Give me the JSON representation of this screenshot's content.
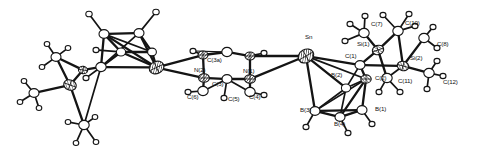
{
  "figure": {
    "kind": "ortep-crystal-structure-diagram",
    "caption": "",
    "background_color": "#ffffff",
    "line_color": "#141414",
    "width": 483,
    "height": 159
  },
  "labels": [
    {
      "id": "Sn",
      "text": "Sn",
      "x": 305,
      "y": 39
    },
    {
      "id": "N1",
      "text": "N(1)",
      "x": 243,
      "y": 73
    },
    {
      "id": "N2",
      "text": "N(2)",
      "x": 194,
      "y": 72
    },
    {
      "id": "C3a",
      "text": "C(3a)",
      "x": 207,
      "y": 62
    },
    {
      "id": "C3",
      "text": "C(3)",
      "x": 212,
      "y": 86
    },
    {
      "id": "C4",
      "text": "C(4)",
      "x": 249,
      "y": 99
    },
    {
      "id": "C5",
      "text": "C(5)",
      "x": 228,
      "y": 101
    },
    {
      "id": "C6",
      "text": "C(6)",
      "x": 187,
      "y": 99
    },
    {
      "id": "C1",
      "text": "C(1)",
      "x": 345,
      "y": 58
    },
    {
      "id": "C2",
      "text": "C(2)",
      "x": 375,
      "y": 80
    },
    {
      "id": "B1",
      "text": "B(1)",
      "x": 375,
      "y": 111
    },
    {
      "id": "B2",
      "text": "B(2)",
      "x": 331,
      "y": 77
    },
    {
      "id": "B3",
      "text": "B(3)",
      "x": 300,
      "y": 112
    },
    {
      "id": "B4",
      "text": "B(4)",
      "x": 334,
      "y": 126
    },
    {
      "id": "Si1",
      "text": "Si(1)",
      "x": 357,
      "y": 46
    },
    {
      "id": "Si2",
      "text": "Si(2)",
      "x": 410,
      "y": 60
    },
    {
      "id": "C7",
      "text": "C(7)",
      "x": 371,
      "y": 26
    },
    {
      "id": "C8",
      "text": "C(8)",
      "x": 437,
      "y": 46
    },
    {
      "id": "C10",
      "text": "C(10)",
      "x": 405,
      "y": 25
    },
    {
      "id": "C11",
      "text": "C(11)",
      "x": 398,
      "y": 83
    },
    {
      "id": "C12",
      "text": "C(12)",
      "x": 443,
      "y": 84
    }
  ],
  "atoms": [
    {
      "id": "Sn",
      "element": "Sn",
      "x": 306.0,
      "y": 56.0,
      "r": 8.2,
      "style": "hatch",
      "rot": -30
    },
    {
      "id": "Fe1",
      "element": "Fe",
      "x": 156.5,
      "y": 67.5,
      "r": 7.6,
      "style": "hatch",
      "rot": -25
    },
    {
      "id": "Si0",
      "element": "Si",
      "x": 70.0,
      "y": 85.0,
      "r": 6.4,
      "style": "hatch2",
      "rot": 20
    },
    {
      "id": "Si0b",
      "element": "Si",
      "x": 83.0,
      "y": 70.0,
      "r": 4.6,
      "style": "hatch2",
      "rot": 10
    },
    {
      "id": "Cp1",
      "element": "C",
      "x": 104.0,
      "y": 34.0,
      "r": 5.0,
      "style": "open"
    },
    {
      "id": "Cp2",
      "element": "C",
      "x": 139.0,
      "y": 33.0,
      "r": 5.0,
      "style": "open"
    },
    {
      "id": "Cp3",
      "element": "C",
      "x": 152.0,
      "y": 52.0,
      "r": 4.4,
      "style": "open"
    },
    {
      "id": "Cp4",
      "element": "C",
      "x": 121.0,
      "y": 52.0,
      "r": 4.6,
      "style": "open"
    },
    {
      "id": "Cp5",
      "element": "C",
      "x": 101.0,
      "y": 67.0,
      "r": 5.2,
      "style": "open"
    },
    {
      "id": "H1",
      "element": "H",
      "x": 89.0,
      "y": 14.0,
      "r": 3.2,
      "style": "open"
    },
    {
      "id": "H2",
      "element": "H",
      "x": 156.0,
      "y": 12.0,
      "r": 3.2,
      "style": "open"
    },
    {
      "id": "H3",
      "element": "H",
      "x": 96.0,
      "y": 50.0,
      "r": 3.0,
      "style": "open"
    },
    {
      "id": "H4",
      "element": "H",
      "x": 86.0,
      "y": 78.0,
      "r": 3.0,
      "style": "open"
    },
    {
      "id": "Ca",
      "element": "C",
      "x": 56.0,
      "y": 57.0,
      "r": 5.0,
      "style": "open"
    },
    {
      "id": "Cb",
      "element": "C",
      "x": 34.0,
      "y": 93.0,
      "r": 5.0,
      "style": "open"
    },
    {
      "id": "Cc",
      "element": "C",
      "x": 84.0,
      "y": 125.0,
      "r": 5.2,
      "style": "open"
    },
    {
      "id": "Ha1",
      "element": "H",
      "x": 47.0,
      "y": 44.0,
      "r": 2.8,
      "style": "open"
    },
    {
      "id": "Ha2",
      "element": "H",
      "x": 68.0,
      "y": 48.0,
      "r": 2.8,
      "style": "open"
    },
    {
      "id": "Ha3",
      "element": "H",
      "x": 42.0,
      "y": 67.0,
      "r": 2.8,
      "style": "open"
    },
    {
      "id": "Hb1",
      "element": "H",
      "x": 24.0,
      "y": 81.0,
      "r": 2.8,
      "style": "open"
    },
    {
      "id": "Hb2",
      "element": "H",
      "x": 20.0,
      "y": 102.0,
      "r": 2.8,
      "style": "open"
    },
    {
      "id": "Hb3",
      "element": "H",
      "x": 39.0,
      "y": 108.0,
      "r": 2.8,
      "style": "open"
    },
    {
      "id": "Hc1",
      "element": "H",
      "x": 68.0,
      "y": 122.0,
      "r": 2.8,
      "style": "open"
    },
    {
      "id": "Hc2",
      "element": "H",
      "x": 95.0,
      "y": 117.0,
      "r": 2.8,
      "style": "open"
    },
    {
      "id": "Hc3",
      "element": "H",
      "x": 76.0,
      "y": 143.0,
      "r": 2.8,
      "style": "open"
    },
    {
      "id": "Hc4",
      "element": "H",
      "x": 96.0,
      "y": 142.0,
      "r": 2.8,
      "style": "open"
    },
    {
      "id": "N2",
      "element": "N",
      "x": 204.0,
      "y": 78.0,
      "r": 5.4,
      "style": "hatch"
    },
    {
      "id": "N1",
      "element": "N",
      "x": 250.0,
      "y": 79.0,
      "r": 5.4,
      "style": "hatch"
    },
    {
      "id": "C3a",
      "element": "C",
      "x": 203.0,
      "y": 55.0,
      "r": 5.0,
      "style": "hatch"
    },
    {
      "id": "Ct2",
      "element": "C",
      "x": 250.0,
      "y": 56.0,
      "r": 5.0,
      "style": "hatch"
    },
    {
      "id": "C3",
      "element": "C",
      "x": 227.0,
      "y": 79.0,
      "r": 5.0,
      "style": "open"
    },
    {
      "id": "Ct1",
      "element": "C",
      "x": 227.0,
      "y": 52.0,
      "r": 5.2,
      "style": "open"
    },
    {
      "id": "C6",
      "element": "C",
      "x": 203.0,
      "y": 91.0,
      "r": 5.2,
      "style": "open"
    },
    {
      "id": "C4",
      "element": "C",
      "x": 250.0,
      "y": 92.0,
      "r": 5.2,
      "style": "open"
    },
    {
      "id": "Hr1",
      "element": "H",
      "x": 193.0,
      "y": 51.0,
      "r": 3.0,
      "style": "open"
    },
    {
      "id": "Hr2",
      "element": "H",
      "x": 264.0,
      "y": 53.0,
      "r": 3.0,
      "style": "open"
    },
    {
      "id": "Hr3",
      "element": "H",
      "x": 188.0,
      "y": 92.0,
      "r": 3.0,
      "style": "open"
    },
    {
      "id": "Hr4",
      "element": "H",
      "x": 264.0,
      "y": 95.0,
      "r": 3.0,
      "style": "open"
    },
    {
      "id": "Hr5",
      "element": "H",
      "x": 224.0,
      "y": 98.0,
      "r": 3.0,
      "style": "open"
    },
    {
      "id": "C1",
      "element": "C",
      "x": 360.0,
      "y": 65.0,
      "r": 5.0,
      "style": "open"
    },
    {
      "id": "C2",
      "element": "C",
      "x": 366.0,
      "y": 79.0,
      "r": 5.2,
      "style": "hatch2"
    },
    {
      "id": "B2",
      "element": "B",
      "x": 346.0,
      "y": 88.0,
      "r": 4.6,
      "style": "open"
    },
    {
      "id": "B1",
      "element": "B",
      "x": 362.0,
      "y": 110.0,
      "r": 5.0,
      "style": "open"
    },
    {
      "id": "B3",
      "element": "B",
      "x": 315.0,
      "y": 111.0,
      "r": 5.0,
      "style": "open"
    },
    {
      "id": "B4",
      "element": "B",
      "x": 340.0,
      "y": 117.0,
      "r": 5.0,
      "style": "open"
    },
    {
      "id": "Hb4",
      "element": "H",
      "x": 306.0,
      "y": 127.0,
      "r": 3.0,
      "style": "open"
    },
    {
      "id": "Hb5",
      "element": "H",
      "x": 348.0,
      "y": 133.0,
      "r": 3.0,
      "style": "open"
    },
    {
      "id": "Hb6",
      "element": "H",
      "x": 372.0,
      "y": 124.0,
      "r": 3.0,
      "style": "open"
    },
    {
      "id": "Si1",
      "element": "Si",
      "x": 378.0,
      "y": 50.0,
      "r": 5.8,
      "style": "hatch2",
      "rot": -20
    },
    {
      "id": "Si2",
      "element": "Si",
      "x": 403.0,
      "y": 66.0,
      "r": 5.8,
      "style": "hatch2",
      "rot": 15
    },
    {
      "id": "C7",
      "element": "C",
      "x": 364.0,
      "y": 33.0,
      "r": 5.2,
      "style": "open"
    },
    {
      "id": "C10",
      "element": "C",
      "x": 398.0,
      "y": 31.0,
      "r": 5.2,
      "style": "open"
    },
    {
      "id": "C8",
      "element": "C",
      "x": 424.0,
      "y": 38.0,
      "r": 5.2,
      "style": "open"
    },
    {
      "id": "C11",
      "element": "C",
      "x": 387.0,
      "y": 78.0,
      "r": 5.2,
      "style": "open"
    },
    {
      "id": "C12",
      "element": "C",
      "x": 429.0,
      "y": 73.0,
      "r": 5.2,
      "style": "open"
    },
    {
      "id": "Hs1",
      "element": "H",
      "x": 350.0,
      "y": 24.0,
      "r": 3.0,
      "style": "open"
    },
    {
      "id": "Hs2",
      "element": "H",
      "x": 365.0,
      "y": 16.0,
      "r": 3.0,
      "style": "open"
    },
    {
      "id": "Hs3",
      "element": "H",
      "x": 345.0,
      "y": 41.0,
      "r": 3.0,
      "style": "open"
    },
    {
      "id": "Hs4",
      "element": "H",
      "x": 383.0,
      "y": 15.0,
      "r": 3.0,
      "style": "open"
    },
    {
      "id": "Hs5",
      "element": "H",
      "x": 409.0,
      "y": 14.0,
      "r": 3.0,
      "style": "open"
    },
    {
      "id": "Hs6",
      "element": "H",
      "x": 415.0,
      "y": 26.0,
      "r": 3.0,
      "style": "open"
    },
    {
      "id": "Hs7",
      "element": "H",
      "x": 433.0,
      "y": 27.0,
      "r": 3.0,
      "style": "open"
    },
    {
      "id": "Hs8",
      "element": "H",
      "x": 437.0,
      "y": 48.0,
      "r": 3.0,
      "style": "open"
    },
    {
      "id": "Hs9",
      "element": "H",
      "x": 379.0,
      "y": 92.0,
      "r": 3.0,
      "style": "open"
    },
    {
      "id": "Hs10",
      "element": "H",
      "x": 400.0,
      "y": 92.0,
      "r": 3.0,
      "style": "open"
    },
    {
      "id": "Hs11",
      "element": "H",
      "x": 437.0,
      "y": 61.0,
      "r": 3.0,
      "style": "open"
    },
    {
      "id": "Hs12",
      "element": "H",
      "x": 443.0,
      "y": 76.0,
      "r": 3.0,
      "style": "open"
    },
    {
      "id": "Hs13",
      "element": "H",
      "x": 427.0,
      "y": 89.0,
      "r": 3.0,
      "style": "open"
    }
  ],
  "bonds": [
    {
      "a": "Cp1",
      "b": "Cp2",
      "w": "thick"
    },
    {
      "a": "Cp2",
      "b": "Cp3",
      "w": "thick"
    },
    {
      "a": "Cp3",
      "b": "Cp4",
      "w": "thick"
    },
    {
      "a": "Cp4",
      "b": "Cp1",
      "w": "thick"
    },
    {
      "a": "Cp4",
      "b": "Cp5",
      "w": "thick"
    },
    {
      "a": "Cp5",
      "b": "Cp1",
      "w": "thick"
    },
    {
      "a": "Cp1",
      "b": "Fe1",
      "w": "thick"
    },
    {
      "a": "Cp2",
      "b": "Fe1",
      "w": "thick"
    },
    {
      "a": "Cp3",
      "b": "Fe1",
      "w": "thick"
    },
    {
      "a": "Cp4",
      "b": "Fe1",
      "w": "thick"
    },
    {
      "a": "Cp5",
      "b": "Fe1",
      "w": "thick"
    },
    {
      "a": "Cp2",
      "b": "Cp5",
      "w": "med"
    },
    {
      "a": "Cp1",
      "b": "Cp3",
      "w": "med"
    },
    {
      "a": "Cp1",
      "b": "H1",
      "w": "med"
    },
    {
      "a": "Cp2",
      "b": "H2",
      "w": "med"
    },
    {
      "a": "Cp4",
      "b": "H3",
      "w": "med"
    },
    {
      "a": "Cp5",
      "b": "H4",
      "w": "med"
    },
    {
      "a": "Cp5",
      "b": "Si0b",
      "w": "thick"
    },
    {
      "a": "Si0b",
      "b": "Si0",
      "w": "thick"
    },
    {
      "a": "Si0b",
      "b": "Ca",
      "w": "thick"
    },
    {
      "a": "Si0",
      "b": "Ca",
      "w": "thick"
    },
    {
      "a": "Si0",
      "b": "Cb",
      "w": "thick"
    },
    {
      "a": "Si0",
      "b": "Cc",
      "w": "thick"
    },
    {
      "a": "Cp5",
      "b": "Cc",
      "w": "med"
    },
    {
      "a": "Ca",
      "b": "Ha1",
      "w": "med"
    },
    {
      "a": "Ca",
      "b": "Ha2",
      "w": "med"
    },
    {
      "a": "Ca",
      "b": "Ha3",
      "w": "med"
    },
    {
      "a": "Cb",
      "b": "Hb1",
      "w": "med"
    },
    {
      "a": "Cb",
      "b": "Hb2",
      "w": "med"
    },
    {
      "a": "Cb",
      "b": "Hb3",
      "w": "med"
    },
    {
      "a": "Cc",
      "b": "Hc1",
      "w": "med"
    },
    {
      "a": "Cc",
      "b": "Hc2",
      "w": "med"
    },
    {
      "a": "Cc",
      "b": "Hc3",
      "w": "med"
    },
    {
      "a": "Cc",
      "b": "Hc4",
      "w": "med"
    },
    {
      "a": "Fe1",
      "b": "C3a",
      "w": "thick"
    },
    {
      "a": "Fe1",
      "b": "N2",
      "w": "thick"
    },
    {
      "a": "C3a",
      "b": "Ct1",
      "w": "thick"
    },
    {
      "a": "Ct1",
      "b": "Ct2",
      "w": "thick"
    },
    {
      "a": "C3a",
      "b": "N2",
      "w": "thick"
    },
    {
      "a": "Ct2",
      "b": "N1",
      "w": "thick"
    },
    {
      "a": "N2",
      "b": "C3",
      "w": "thick"
    },
    {
      "a": "C3",
      "b": "N1",
      "w": "thick"
    },
    {
      "a": "N2",
      "b": "C6",
      "w": "thick"
    },
    {
      "a": "N1",
      "b": "C4",
      "w": "thick"
    },
    {
      "a": "C6",
      "b": "C3",
      "w": "med"
    },
    {
      "a": "C3",
      "b": "C4",
      "w": "med"
    },
    {
      "a": "C3a",
      "b": "Hr1",
      "w": "med"
    },
    {
      "a": "Ct2",
      "b": "Hr2",
      "w": "med"
    },
    {
      "a": "C6",
      "b": "Hr3",
      "w": "med"
    },
    {
      "a": "C4",
      "b": "Hr4",
      "w": "med"
    },
    {
      "a": "C3",
      "b": "Hr5",
      "w": "med"
    },
    {
      "a": "Ct1",
      "b": "Hr1",
      "w": "thin"
    },
    {
      "a": "N1",
      "b": "Sn",
      "w": "thick"
    },
    {
      "a": "Ct2",
      "b": "Sn",
      "w": "thick"
    },
    {
      "a": "Sn",
      "b": "C1",
      "w": "thick"
    },
    {
      "a": "Sn",
      "b": "B2",
      "w": "thick"
    },
    {
      "a": "Sn",
      "b": "B3",
      "w": "thick"
    },
    {
      "a": "Sn",
      "b": "C2",
      "w": "med"
    },
    {
      "a": "C1",
      "b": "C2",
      "w": "thick"
    },
    {
      "a": "C1",
      "b": "B2",
      "w": "med"
    },
    {
      "a": "C2",
      "b": "B1",
      "w": "thick"
    },
    {
      "a": "C2",
      "b": "B4",
      "w": "thick"
    },
    {
      "a": "C2",
      "b": "B2",
      "w": "med"
    },
    {
      "a": "B2",
      "b": "B3",
      "w": "med"
    },
    {
      "a": "B2",
      "b": "B4",
      "w": "med"
    },
    {
      "a": "B3",
      "b": "B4",
      "w": "thick"
    },
    {
      "a": "B4",
      "b": "B1",
      "w": "thick"
    },
    {
      "a": "B3",
      "b": "B1",
      "w": "thick"
    },
    {
      "a": "B3",
      "b": "C2",
      "w": "med"
    },
    {
      "a": "B3",
      "b": "Hb4",
      "w": "med"
    },
    {
      "a": "B4",
      "b": "Hb5",
      "w": "med"
    },
    {
      "a": "B1",
      "b": "Hb6",
      "w": "med"
    },
    {
      "a": "C1",
      "b": "Si1",
      "w": "thick"
    },
    {
      "a": "C1",
      "b": "Si2",
      "w": "thick"
    },
    {
      "a": "Si1",
      "b": "C7",
      "w": "thick"
    },
    {
      "a": "Si1",
      "b": "C10",
      "w": "thick"
    },
    {
      "a": "Si1",
      "b": "C11",
      "w": "thick"
    },
    {
      "a": "Si2",
      "b": "C8",
      "w": "thick"
    },
    {
      "a": "Si2",
      "b": "C10",
      "w": "thick"
    },
    {
      "a": "Si2",
      "b": "C12",
      "w": "thick"
    },
    {
      "a": "Si2",
      "b": "C11",
      "w": "med"
    },
    {
      "a": "C7",
      "b": "Hs1",
      "w": "med"
    },
    {
      "a": "C7",
      "b": "Hs2",
      "w": "med"
    },
    {
      "a": "C7",
      "b": "Hs3",
      "w": "med"
    },
    {
      "a": "C10",
      "b": "Hs4",
      "w": "med"
    },
    {
      "a": "C10",
      "b": "Hs5",
      "w": "med"
    },
    {
      "a": "C10",
      "b": "Hs6",
      "w": "med"
    },
    {
      "a": "C8",
      "b": "Hs7",
      "w": "med"
    },
    {
      "a": "C8",
      "b": "Hs8",
      "w": "med"
    },
    {
      "a": "C11",
      "b": "Hs9",
      "w": "med"
    },
    {
      "a": "C11",
      "b": "Hs10",
      "w": "med"
    },
    {
      "a": "C12",
      "b": "Hs11",
      "w": "med"
    },
    {
      "a": "C12",
      "b": "Hs12",
      "w": "med"
    },
    {
      "a": "C12",
      "b": "Hs13",
      "w": "med"
    }
  ]
}
